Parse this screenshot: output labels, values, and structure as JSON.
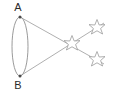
{
  "diagram": {
    "title": "",
    "canvas": {
      "width": 114,
      "height": 91,
      "background": "#ffffff"
    },
    "colors": {
      "stroke": "#9a9a9a",
      "ellipse_stroke": "#8f8f8f",
      "star_stroke": "#9a9a9a",
      "label": "#2b2b2b",
      "point_fill": "#4a4a4a"
    },
    "ellipse": {
      "name": "aperture-ellipse",
      "cx": 20,
      "cy": 46.5,
      "rx": 8,
      "ry": 29.5
    },
    "points": [
      {
        "id": "A",
        "label": "A",
        "x": 20,
        "y": 17,
        "label_x": 18,
        "label_y": 11
      },
      {
        "id": "B",
        "label": "B",
        "x": 20,
        "y": 76,
        "label_x": 18,
        "label_y": 89
      }
    ],
    "stars": [
      {
        "id": "center",
        "label": "",
        "x": 72,
        "y": 43,
        "r": 8,
        "points": 5,
        "rotation": 18
      },
      {
        "id": "upper-right",
        "label": "",
        "x": 97,
        "y": 27,
        "r": 8,
        "points": 5,
        "rotation": 8
      },
      {
        "id": "lower-right",
        "label": "",
        "x": 97,
        "y": 59,
        "r": 8,
        "points": 5,
        "rotation": 8
      }
    ],
    "rays": [
      {
        "id": "ray-a-to-upper",
        "from": "A",
        "through": "center",
        "to": "upper-right",
        "x1": 20,
        "y1": 17,
        "x2": 97,
        "y2": 59
      },
      {
        "id": "ray-b-to-lower",
        "from": "B",
        "through": "center",
        "to": "lower-right",
        "x1": 20,
        "y1": 76,
        "x2": 97,
        "y2": 27
      }
    ]
  }
}
